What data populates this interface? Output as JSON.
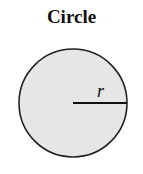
{
  "diagram": {
    "title": "Circle",
    "shape": "circle",
    "fill_color": "#e6e6e6",
    "stroke_color": "#222222",
    "center": {
      "x": 73,
      "y": 103
    },
    "radius_px": 54,
    "radius_line": {
      "x1": 73,
      "y1": 103,
      "x2": 127,
      "y2": 103
    },
    "radius_label": "r"
  }
}
